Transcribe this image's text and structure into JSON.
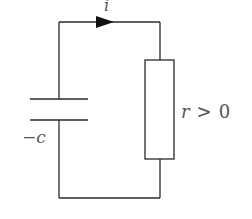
{
  "diagram": {
    "type": "circuit",
    "components": {
      "capacitor": {
        "label": "−c"
      },
      "resistor": {
        "label_var": "r",
        "label_op": ">",
        "label_val": "0"
      },
      "current": {
        "label": "i",
        "direction": "clockwise"
      }
    },
    "colors": {
      "stroke": "#2a2a2a",
      "text": "#555555",
      "background": "#ffffff"
    }
  }
}
